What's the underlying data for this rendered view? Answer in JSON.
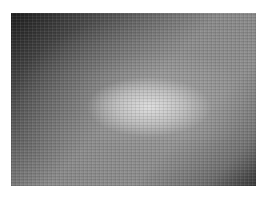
{
  "image": {
    "description": "Grayscale textured photograph with a lighter central blob",
    "colors": {
      "dark_corner": "#1e1e1e",
      "mid_gray": "#8a8a8a",
      "highlight": "#e1e1e1",
      "border": "#ffffff"
    }
  }
}
